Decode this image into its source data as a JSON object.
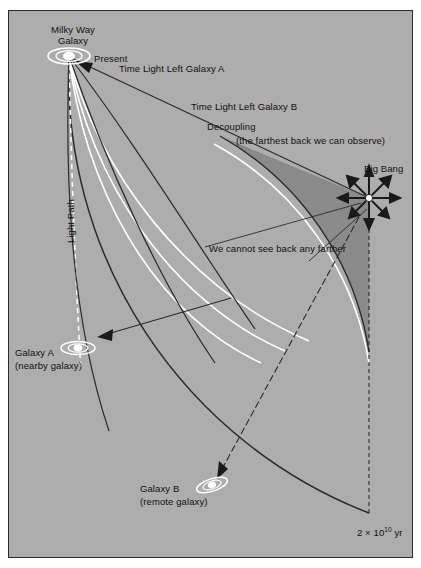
{
  "figure": {
    "background_color": "#adadad",
    "shaded_region_color": "#8a8a8a",
    "border_color": "#2b2b2b",
    "light_path_color": "#ffffff"
  },
  "labels": {
    "milky_way_line1": "Milky Way",
    "milky_way_line2": "Galaxy",
    "present": "Present",
    "time_light_left_a": "Time Light Left Galaxy A",
    "time_light_left_b": "Time Light Left Galaxy B",
    "decoupling": "Decoupling",
    "decoupling_note": "(the farthest back we can observe)",
    "big_bang": "Big Bang",
    "cannot_see": "We cannot see back any farther",
    "light_path": "Light Path",
    "galaxy_a_line1": "Galaxy A",
    "galaxy_a_line2": "(nearby galaxy)",
    "galaxy_b_line1": "Galaxy B",
    "galaxy_b_line2": "(remote galaxy)",
    "time_scale_prefix": "2 × 10",
    "time_scale_exp": "10",
    "time_scale_unit": " yr"
  },
  "icons": {
    "milky_way": "spiral-galaxy-icon",
    "galaxy_a": "spiral-galaxy-icon",
    "galaxy_b": "spiral-galaxy-icon",
    "big_bang": "starburst-icon"
  }
}
